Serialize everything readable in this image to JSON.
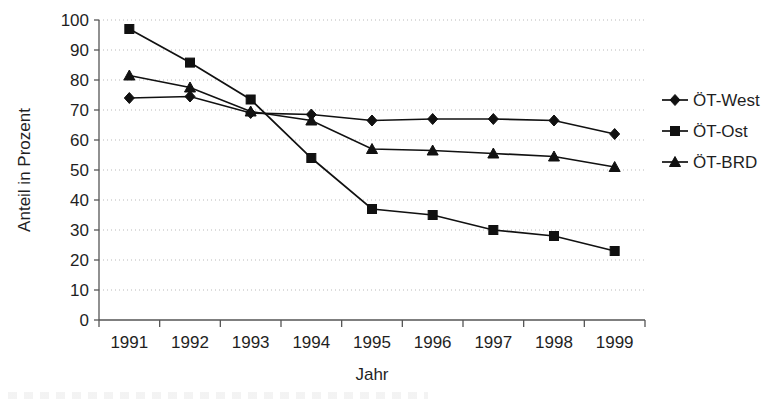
{
  "chart_data": {
    "type": "line",
    "title": "",
    "xlabel": "Jahr",
    "ylabel": "Anteil in Prozent",
    "categories": [
      "1991",
      "1992",
      "1993",
      "1994",
      "1995",
      "1996",
      "1997",
      "1998",
      "1999"
    ],
    "x": [
      1991,
      1992,
      1993,
      1994,
      1995,
      1996,
      1997,
      1998,
      1999
    ],
    "ylim": [
      0,
      100
    ],
    "ytick_labels": [
      "0",
      "10",
      "20",
      "30",
      "40",
      "50",
      "60",
      "70",
      "80",
      "90",
      "100"
    ],
    "yticks": [
      0,
      10,
      20,
      30,
      40,
      50,
      60,
      70,
      80,
      90,
      100
    ],
    "grid": "horizontal-dotted",
    "legend_position": "right",
    "series": [
      {
        "name": "ÖT-West",
        "marker": "diamond",
        "values": [
          74,
          74.5,
          69,
          68.5,
          66.5,
          67,
          67,
          66.5,
          62
        ]
      },
      {
        "name": "ÖT-Ost",
        "marker": "square",
        "values": [
          97,
          85.8,
          73.5,
          54,
          37,
          35,
          30,
          28,
          23
        ]
      },
      {
        "name": "ÖT-BRD",
        "marker": "triangle",
        "values": [
          81.5,
          77.5,
          69.5,
          66.5,
          57,
          56.5,
          55.5,
          54.5,
          51
        ]
      }
    ],
    "colors": {
      "line": "#111111",
      "grid": "#b9b9b9",
      "axis": "#555555",
      "text": "#1f1f1f"
    }
  },
  "legend": {
    "items": [
      {
        "label": "ÖT-West",
        "marker": "diamond"
      },
      {
        "label": "ÖT-Ost",
        "marker": "square"
      },
      {
        "label": "ÖT-BRD",
        "marker": "triangle"
      }
    ]
  },
  "axes": {
    "y_title": "Anteil in Prozent",
    "x_title": "Jahr"
  }
}
